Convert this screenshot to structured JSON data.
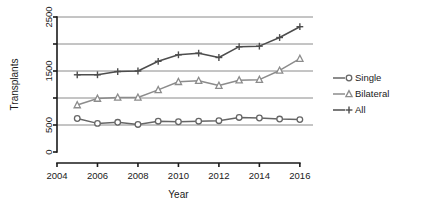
{
  "chart_data": {
    "type": "line",
    "title": "",
    "xlabel": "Year",
    "ylabel": "Transplants",
    "x": [
      2005,
      2006,
      2007,
      2008,
      2009,
      2010,
      2011,
      2012,
      2013,
      2014,
      2015,
      2016
    ],
    "xlim": [
      2004,
      2016.6
    ],
    "ylim": [
      0,
      2500
    ],
    "xticks": [
      2004,
      2006,
      2008,
      2010,
      2012,
      2014,
      2016
    ],
    "xtick_labels": [
      "2004",
      "2006",
      "2008",
      "2010",
      "2012",
      "2014",
      "2016"
    ],
    "yticks": [
      0,
      500,
      1000,
      1500,
      2000,
      2500
    ],
    "ytick_labels": [
      "0",
      "500",
      "",
      "1500",
      "",
      "2500"
    ],
    "gridlines": [
      500,
      1000,
      1500,
      2000,
      2500
    ],
    "grid": true,
    "legend_position": "right",
    "series": [
      {
        "name": "Single",
        "marker": "circle",
        "color": "#666666",
        "values": [
          620,
          530,
          550,
          510,
          570,
          560,
          570,
          580,
          640,
          630,
          610,
          600
        ]
      },
      {
        "name": "Bilateral",
        "marker": "triangle",
        "color": "#8c8c8c",
        "values": [
          870,
          990,
          1010,
          1010,
          1150,
          1300,
          1320,
          1230,
          1330,
          1340,
          1510,
          1730
        ]
      },
      {
        "name": "All",
        "marker": "plus",
        "color": "#4d4d4d",
        "values": [
          1430,
          1430,
          1490,
          1500,
          1680,
          1800,
          1830,
          1750,
          1950,
          1960,
          2120,
          2320
        ]
      }
    ]
  },
  "legend": {
    "items": [
      {
        "label": "Single"
      },
      {
        "label": "Bilateral"
      },
      {
        "label": "All"
      }
    ]
  },
  "axes": {
    "x_title": "Year",
    "y_title": "Transplants"
  }
}
